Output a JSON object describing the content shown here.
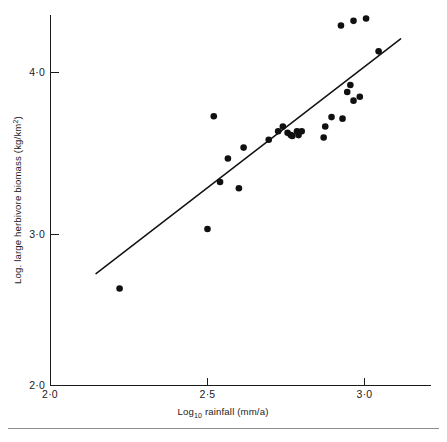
{
  "figure": {
    "background_color": "#ffffff",
    "ink_color": "#101010",
    "width": 447,
    "height": 442
  },
  "axes": {
    "x_tick_labels": [
      "2·0",
      "2·5",
      "3·0"
    ],
    "x_tick_values": [
      2.0,
      2.5,
      3.0
    ],
    "y_tick_labels": [
      "2·0",
      "3·0",
      "4·0"
    ],
    "y_tick_values": [
      2.0,
      3.0,
      4.0
    ],
    "x_title_main": "Log",
    "x_title_sub": "10",
    "x_title_rest": " rainfall (mm/a)",
    "y_title_main": "Log. large herbivore biomass (kg/km",
    "y_title_sup": "2",
    "y_title_close": ")"
  },
  "chart_data": {
    "type": "scatter",
    "title": "",
    "xlabel": "Log10 rainfall (mm/a)",
    "ylabel": "Log. large herbivore biomass (kg/km2)",
    "xlim": [
      2.0,
      3.18
    ],
    "ylim": [
      2.0,
      4.45
    ],
    "xticks": [
      2.0,
      2.5,
      3.0
    ],
    "yticks": [
      2.0,
      3.0,
      4.0
    ],
    "grid": false,
    "legend": null,
    "marker": "filled-circle",
    "marker_color": "#101010",
    "points": [
      {
        "x": 2.22,
        "y": 2.62
      },
      {
        "x": 2.5,
        "y": 3.0
      },
      {
        "x": 2.52,
        "y": 3.72
      },
      {
        "x": 2.54,
        "y": 3.3
      },
      {
        "x": 2.6,
        "y": 3.26
      },
      {
        "x": 2.565,
        "y": 3.45
      },
      {
        "x": 2.615,
        "y": 3.52
      },
      {
        "x": 2.695,
        "y": 3.57
      },
      {
        "x": 2.74,
        "y": 3.655
      },
      {
        "x": 2.725,
        "y": 3.625
      },
      {
        "x": 2.755,
        "y": 3.615
      },
      {
        "x": 2.765,
        "y": 3.6
      },
      {
        "x": 2.77,
        "y": 3.595
      },
      {
        "x": 2.785,
        "y": 3.625
      },
      {
        "x": 2.8,
        "y": 3.625
      },
      {
        "x": 2.79,
        "y": 3.6
      },
      {
        "x": 2.875,
        "y": 3.655
      },
      {
        "x": 2.87,
        "y": 3.585
      },
      {
        "x": 2.895,
        "y": 3.715
      },
      {
        "x": 2.93,
        "y": 3.705
      },
      {
        "x": 2.945,
        "y": 3.875
      },
      {
        "x": 2.955,
        "y": 3.92
      },
      {
        "x": 2.965,
        "y": 3.82
      },
      {
        "x": 2.985,
        "y": 3.845
      },
      {
        "x": 2.925,
        "y": 4.3
      },
      {
        "x": 2.965,
        "y": 4.33
      },
      {
        "x": 3.005,
        "y": 4.345
      },
      {
        "x": 3.045,
        "y": 4.135
      }
    ],
    "fit_line": {
      "label": "regression line",
      "x_start": 2.145,
      "y_start": 2.715,
      "x_end": 3.115,
      "y_end": 4.215
    },
    "n_points": 28
  }
}
